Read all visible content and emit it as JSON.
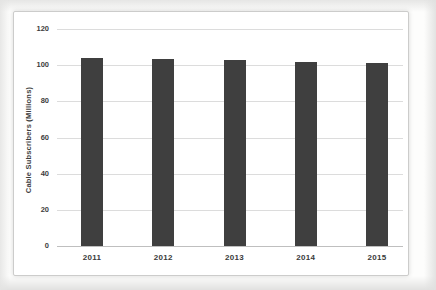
{
  "chart_data": {
    "type": "bar",
    "title": "",
    "ylabel": "Cable Subscribers (Millions)",
    "xlabel": "",
    "categories": [
      "2011",
      "2012",
      "2013",
      "2014",
      "2015"
    ],
    "values": [
      104,
      103.5,
      103,
      102,
      101
    ],
    "ylim": [
      0,
      120
    ],
    "yticks": [
      0,
      20,
      40,
      60,
      80,
      100,
      120
    ],
    "grid": true,
    "legend": "none",
    "colors": {
      "bar": "#3f3f3f",
      "gridline": "#dcdcdc",
      "axis_line": "#bfbfbf",
      "tick_text": "#3d3d3d",
      "frame_border": "#cccccb",
      "background": "#ffffff"
    }
  }
}
